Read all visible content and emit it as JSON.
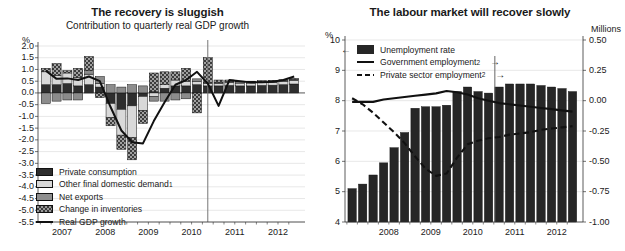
{
  "chart_data": [
    {
      "id": "recovery",
      "type": "bar",
      "title": "The recovery is sluggish",
      "subtitle": "Contribution to quarterly real GDP growth",
      "ylabel": "%",
      "xlabel": "",
      "ylim": [
        -5.5,
        2.0
      ],
      "yticks": [
        "2.0",
        "1.5",
        "1.0",
        "0.5",
        "0.0",
        "-0.5",
        "-1.0",
        "-1.5",
        "-2.0",
        "-2.5",
        "-3.0",
        "-3.5",
        "-4.0",
        "-4.5",
        "-5.0",
        "-5.5"
      ],
      "ytick_values": [
        2.0,
        1.5,
        1.0,
        0.5,
        0.0,
        -0.5,
        -1.0,
        -1.5,
        -2.0,
        -2.5,
        -3.0,
        -3.5,
        -4.0,
        -4.5,
        -5.0,
        -5.5
      ],
      "xticks": [
        "2007",
        "2008",
        "2009",
        "2010",
        "2011",
        "2012"
      ],
      "xtick_values": [
        2007,
        2008,
        2009,
        2010,
        2011,
        2012
      ],
      "grid": true,
      "stacked": true,
      "forecast_divider": 2010.75,
      "legend_position": "bottom-left",
      "legend": [
        {
          "label": "Private consumption",
          "swatch": "dark"
        },
        {
          "label": "Other final domestic demand",
          "footnote": "1",
          "swatch": "light"
        },
        {
          "label": "Net exports",
          "swatch": "mid"
        },
        {
          "label": "Change in inventories",
          "swatch": "checker"
        },
        {
          "label": "Real GDP growth",
          "swatch": "solid-line"
        }
      ],
      "x": [
        2007.0,
        2007.25,
        2007.5,
        2007.75,
        2008.0,
        2008.25,
        2008.5,
        2008.75,
        2009.0,
        2009.25,
        2009.5,
        2009.75,
        2010.0,
        2010.25,
        2010.5,
        2010.75,
        2011.0,
        2011.25,
        2011.5,
        2011.75,
        2012.0,
        2012.25,
        2012.5,
        2012.75
      ],
      "series": [
        {
          "name": "Private consumption",
          "swatch": "dark",
          "values": [
            0.35,
            0.35,
            0.4,
            0.3,
            0.35,
            0.25,
            -0.45,
            -0.7,
            -0.55,
            -0.15,
            0.05,
            0.2,
            0.3,
            0.3,
            0.35,
            0.3,
            0.3,
            0.32,
            0.3,
            0.3,
            0.32,
            0.33,
            0.35,
            0.38
          ]
        },
        {
          "name": "Other final domestic demand",
          "swatch": "light",
          "values": [
            0.55,
            0.4,
            0.45,
            0.35,
            0.45,
            0.15,
            -0.6,
            -1.1,
            -1.35,
            -0.6,
            -0.15,
            0.15,
            0.25,
            0.2,
            0.15,
            0.1,
            0.1,
            0.12,
            0.12,
            0.12,
            0.12,
            0.12,
            0.13,
            0.15
          ]
        },
        {
          "name": "Net exports",
          "swatch": "mid",
          "values": [
            -0.45,
            -0.35,
            -0.3,
            -0.3,
            0.15,
            0.3,
            0.35,
            0.25,
            0.35,
            0.3,
            -0.2,
            -0.35,
            -0.3,
            -0.25,
            0.1,
            0.05,
            0.05,
            0.06,
            0.06,
            0.06,
            0.06,
            0.06,
            0.06,
            0.06
          ]
        },
        {
          "name": "Change in inventories",
          "swatch": "checker",
          "values": [
            0.15,
            0.5,
            0.1,
            0.4,
            0.6,
            -0.2,
            -0.35,
            -0.6,
            -0.95,
            -0.55,
            0.8,
            0.55,
            0.35,
            0.55,
            -0.85,
            1.05,
            0.1,
            0.05,
            0.02,
            0.02,
            0.02,
            0.02,
            0.02,
            0.02
          ]
        }
      ],
      "line": {
        "name": "Real GDP growth",
        "style": "solid",
        "values": [
          0.95,
          0.6,
          0.62,
          0.55,
          0.7,
          0.5,
          -0.6,
          -1.6,
          -2.1,
          -2.15,
          -1.2,
          -0.4,
          0.35,
          0.55,
          0.9,
          0.4,
          -0.55,
          0.55,
          0.5,
          0.45,
          0.45,
          0.48,
          0.55,
          0.7
        ]
      }
    },
    {
      "id": "labour",
      "type": "bar",
      "title": "The labour market will recover slowly",
      "subtitle": "",
      "ylabel": "%",
      "ylabel_right": "Millions",
      "xlabel": "",
      "ylim": [
        4,
        10
      ],
      "yticks": [
        "10",
        "9",
        "8",
        "7",
        "6",
        "5",
        "4"
      ],
      "ytick_values": [
        10,
        9,
        8,
        7,
        6,
        5,
        4
      ],
      "ylim_right": [
        -1.0,
        0.5
      ],
      "yticks_right": [
        "0.50",
        "0.25",
        "0.00",
        "-0.25",
        "-0.50",
        "-0.75",
        "-1.00"
      ],
      "ytick_values_right": [
        0.5,
        0.25,
        0.0,
        -0.25,
        -0.5,
        -0.75,
        -1.0
      ],
      "xticks": [
        "2008",
        "2009",
        "2010",
        "2011",
        "2012"
      ],
      "xtick_values": [
        2008,
        2009,
        2010,
        2011,
        2012
      ],
      "grid": true,
      "forecast_divider": 2010.9,
      "legend_position": "top-left",
      "legend": [
        {
          "label": "Unemployment rate",
          "swatch": "bar-black",
          "arrow": "left"
        },
        {
          "label": "Government employment",
          "footnote": "2",
          "swatch": "solid-line",
          "arrow": "right"
        },
        {
          "label": "Private sector employment",
          "footnote": "2",
          "swatch": "dash-line",
          "arrow": "right"
        }
      ],
      "x": [
        2007.5,
        2007.75,
        2008.0,
        2008.25,
        2008.5,
        2008.75,
        2009.0,
        2009.25,
        2009.5,
        2009.75,
        2010.0,
        2010.25,
        2010.5,
        2010.75,
        2011.0,
        2011.25,
        2011.5,
        2011.75,
        2012.0,
        2012.25,
        2012.5,
        2012.75
      ],
      "series": [
        {
          "name": "Unemployment rate",
          "axis": "left",
          "swatch": "bar-black",
          "values": [
            5.1,
            5.25,
            5.55,
            5.95,
            6.45,
            6.95,
            7.75,
            7.8,
            7.8,
            7.85,
            8.3,
            8.45,
            8.3,
            8.25,
            8.45,
            8.55,
            8.55,
            8.55,
            8.5,
            8.45,
            8.4,
            8.3
          ]
        }
      ],
      "lines": [
        {
          "name": "Government employment",
          "axis": "right",
          "style": "solid",
          "values": [
            -0.01,
            -0.01,
            -0.01,
            0.01,
            0.02,
            0.03,
            0.04,
            0.05,
            0.06,
            0.08,
            0.07,
            0.05,
            0.02,
            0.0,
            -0.02,
            -0.03,
            -0.04,
            -0.05,
            -0.06,
            -0.07,
            -0.08,
            -0.09
          ]
        },
        {
          "name": "Private sector employment",
          "axis": "right",
          "style": "dashed",
          "values": [
            0.02,
            -0.03,
            -0.1,
            -0.18,
            -0.26,
            -0.35,
            -0.46,
            -0.56,
            -0.62,
            -0.6,
            -0.47,
            -0.36,
            -0.33,
            -0.31,
            -0.3,
            -0.28,
            -0.27,
            -0.26,
            -0.24,
            -0.23,
            -0.22,
            -0.21
          ]
        }
      ]
    }
  ]
}
